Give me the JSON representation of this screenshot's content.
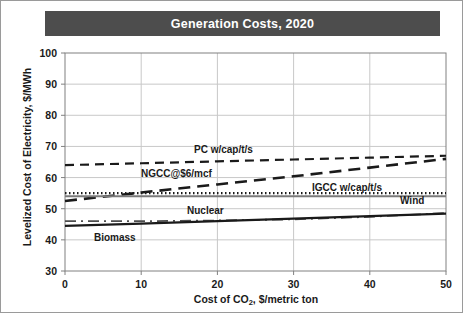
{
  "title": "Generation Costs, 2020",
  "colors": {
    "title_bar_bg": "#4d4d4d",
    "title_text": "#ffffff",
    "frame_border": "#9a9a9a",
    "grid": "#c8c8c8",
    "axis": "#808080",
    "dark_line": "#1a1a1a",
    "gray_line": "#7a7a7a",
    "plot_bg": "#ffffff"
  },
  "chart_data": {
    "type": "line",
    "title": "Generation Costs, 2020",
    "xlabel": "Cost of CO2, $/metric ton",
    "ylabel": "Levelized Cost of Electricity, $/MWh",
    "xlim": [
      0,
      50
    ],
    "ylim": [
      30,
      100
    ],
    "xticks": [
      "0",
      "10",
      "20",
      "30",
      "40",
      "50"
    ],
    "yticks": [
      "30",
      "40",
      "50",
      "60",
      "70",
      "80",
      "90",
      "100"
    ],
    "grid": true,
    "legend_position": "inline-annotations",
    "x": [
      0,
      10,
      20,
      30,
      40,
      50
    ],
    "series": [
      {
        "name": "PC w/cap/t/s",
        "label": "PC w/cap/t/s",
        "style": "dashed",
        "color": "#1a1a1a",
        "values": [
          64.0,
          64.6,
          65.2,
          65.8,
          66.4,
          67.0
        ]
      },
      {
        "name": "NGCC@$6/mcf",
        "label": "NGCC@$6/mcf",
        "style": "dashed-long",
        "color": "#1a1a1a",
        "values": [
          52.5,
          55.2,
          57.8,
          60.4,
          63.2,
          66.0
        ]
      },
      {
        "name": "IGCC w/cap/t/s",
        "label": "IGCC w/cap/t/s",
        "style": "dotted",
        "color": "#1a1a1a",
        "values": [
          55.0,
          55.0,
          55.0,
          55.0,
          55.0,
          55.0
        ]
      },
      {
        "name": "Wind",
        "label": "Wind",
        "style": "solid-gray",
        "color": "#7a7a7a",
        "values": [
          54.0,
          54.0,
          54.0,
          54.0,
          54.0,
          54.0
        ]
      },
      {
        "name": "Nuclear",
        "label": "Nuclear",
        "style": "dash-dot",
        "color": "#4d4d4d",
        "values": [
          46.0,
          46.0,
          46.2,
          46.6,
          47.4,
          48.6
        ]
      },
      {
        "name": "Biomass",
        "label": "Biomass",
        "style": "solid-black",
        "color": "#1a1a1a",
        "values": [
          44.5,
          45.2,
          46.0,
          46.8,
          47.6,
          48.4
        ]
      }
    ]
  }
}
